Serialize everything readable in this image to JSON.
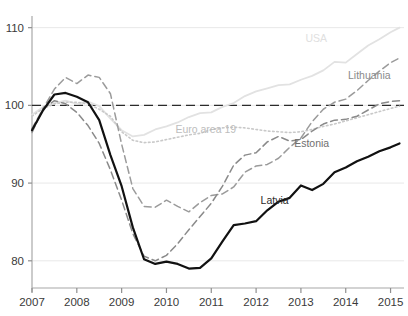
{
  "chart_data": {
    "type": "line",
    "title": "",
    "subtitle": "",
    "xlabel": "",
    "ylabel": "",
    "xlim": [
      2007.0,
      2015.3
    ],
    "ylim": [
      76.5,
      111.5
    ],
    "xticks": [
      2007,
      2008,
      2009,
      2010,
      2011,
      2012,
      2013,
      2014,
      2015
    ],
    "xtick_labels": [
      "2007",
      "2008",
      "2009",
      "2010",
      "2011",
      "2012",
      "2013",
      "2014",
      "2015"
    ],
    "yticks": [
      80,
      90,
      100,
      110
    ],
    "ytick_labels": [
      "80",
      "90",
      "100",
      "110"
    ],
    "grid": "horizontal",
    "legend_position": "inline-labels",
    "reference_line": {
      "value": 100,
      "style": "dashed",
      "color": "#2b2b2b"
    },
    "series": [
      {
        "name": "Latvia",
        "style": "solid",
        "width": 2.2,
        "color": "#111111",
        "label_color": "#2b2b2b",
        "label_x": 2012.1,
        "label_y": 87.3,
        "x": [
          2007.0,
          2007.25,
          2007.5,
          2007.75,
          2008.0,
          2008.25,
          2008.5,
          2008.75,
          2009.0,
          2009.25,
          2009.5,
          2009.75,
          2010.0,
          2010.25,
          2010.5,
          2010.75,
          2011.0,
          2011.25,
          2011.5,
          2011.75,
          2012.0,
          2012.25,
          2012.5,
          2012.75,
          2013.0,
          2013.25,
          2013.5,
          2013.75,
          2014.0,
          2014.25,
          2014.5,
          2014.75,
          2015.0,
          2015.2
        ],
        "y": [
          96.8,
          99.4,
          101.4,
          101.6,
          101.1,
          100.4,
          98.1,
          93.6,
          89.6,
          84.3,
          80.2,
          79.6,
          79.9,
          79.6,
          79.0,
          79.1,
          80.3,
          82.5,
          84.6,
          84.8,
          85.1,
          86.5,
          87.6,
          88.1,
          89.7,
          89.1,
          89.9,
          91.4,
          92.0,
          92.8,
          93.4,
          94.1,
          94.6,
          95.1
        ]
      },
      {
        "name": "Estonia",
        "style": "dashed",
        "width": 1.5,
        "color": "#8a8a8a",
        "label_color": "#6f6f6f",
        "label_x": 2012.85,
        "label_y": 94.6,
        "x": [
          2007.0,
          2007.25,
          2007.5,
          2007.75,
          2008.0,
          2008.25,
          2008.5,
          2008.75,
          2009.0,
          2009.25,
          2009.5,
          2009.75,
          2010.0,
          2010.25,
          2010.5,
          2010.75,
          2011.0,
          2011.25,
          2011.5,
          2011.75,
          2012.0,
          2012.25,
          2012.5,
          2012.75,
          2013.0,
          2013.25,
          2013.5,
          2013.75,
          2014.0,
          2014.25,
          2014.5,
          2014.75,
          2015.0,
          2015.2
        ],
        "y": [
          97.0,
          99.6,
          100.6,
          100.2,
          99.1,
          97.4,
          95.1,
          91.7,
          87.8,
          83.5,
          80.6,
          80.0,
          80.7,
          82.2,
          84.0,
          85.7,
          87.4,
          89.6,
          92.3,
          93.6,
          93.9,
          95.3,
          96.0,
          95.4,
          95.6,
          96.7,
          97.6,
          98.1,
          98.2,
          98.6,
          99.4,
          100.2,
          100.5,
          100.6
        ]
      },
      {
        "name": "Lithuania",
        "style": "dashed",
        "width": 1.5,
        "color": "#9b9b9b",
        "label_color": "#8a8a8a",
        "label_x": 2014.05,
        "label_y": 103.4,
        "x": [
          2007.0,
          2007.25,
          2007.5,
          2007.75,
          2008.0,
          2008.25,
          2008.5,
          2008.75,
          2009.0,
          2009.25,
          2009.5,
          2009.75,
          2010.0,
          2010.25,
          2010.5,
          2010.75,
          2011.0,
          2011.25,
          2011.5,
          2011.75,
          2012.0,
          2012.25,
          2012.5,
          2012.75,
          2013.0,
          2013.25,
          2013.5,
          2013.75,
          2014.0,
          2014.25,
          2014.5,
          2014.75,
          2015.0,
          2015.2
        ],
        "y": [
          96.5,
          99.6,
          102.1,
          103.6,
          102.8,
          103.9,
          103.6,
          101.5,
          95.0,
          89.3,
          87.0,
          86.9,
          87.8,
          87.0,
          86.3,
          87.5,
          88.4,
          88.6,
          89.5,
          91.4,
          92.2,
          92.4,
          93.2,
          94.6,
          95.8,
          97.9,
          99.5,
          100.4,
          100.8,
          101.9,
          103.2,
          104.4,
          105.5,
          106.1
        ]
      },
      {
        "name": "Euro area 19",
        "style": "dotted",
        "width": 1.6,
        "color": "#c9c9c9",
        "label_color": "#bdbdbd",
        "label_x": 2010.2,
        "label_y": 96.5,
        "x": [
          2007.0,
          2007.25,
          2007.5,
          2007.75,
          2008.0,
          2008.25,
          2008.5,
          2008.75,
          2009.0,
          2009.25,
          2009.5,
          2009.75,
          2010.0,
          2010.25,
          2010.5,
          2010.75,
          2011.0,
          2011.25,
          2011.5,
          2011.75,
          2012.0,
          2012.25,
          2012.5,
          2012.75,
          2013.0,
          2013.25,
          2013.5,
          2013.75,
          2014.0,
          2014.25,
          2014.5,
          2014.75,
          2015.0,
          2015.2
        ],
        "y": [
          98.6,
          99.6,
          100.2,
          100.4,
          100.4,
          100.2,
          99.5,
          98.6,
          96.6,
          95.5,
          95.2,
          95.3,
          95.6,
          95.9,
          96.2,
          96.4,
          96.9,
          97.1,
          97.2,
          97.1,
          96.9,
          96.7,
          96.6,
          96.5,
          96.6,
          96.9,
          97.3,
          97.6,
          98.0,
          98.4,
          98.8,
          99.2,
          99.6,
          99.9
        ]
      },
      {
        "name": "USA",
        "style": "solid",
        "width": 1.8,
        "color": "#e2e2e2",
        "label_color": "#e0e0e0",
        "label_x": 2013.1,
        "label_y": 108.1,
        "x": [
          2007.0,
          2007.25,
          2007.5,
          2007.75,
          2008.0,
          2008.25,
          2008.5,
          2008.75,
          2009.0,
          2009.25,
          2009.5,
          2009.75,
          2010.0,
          2010.25,
          2010.5,
          2010.75,
          2011.0,
          2011.25,
          2011.5,
          2011.75,
          2012.0,
          2012.25,
          2012.5,
          2012.75,
          2013.0,
          2013.25,
          2013.5,
          2013.75,
          2014.0,
          2014.25,
          2014.5,
          2014.75,
          2015.0,
          2015.2
        ],
        "y": [
          98.8,
          99.8,
          100.3,
          100.6,
          100.2,
          100.5,
          99.9,
          98.3,
          96.8,
          96.0,
          96.2,
          96.9,
          97.3,
          97.8,
          98.5,
          99.0,
          99.1,
          99.8,
          100.3,
          101.2,
          101.8,
          102.2,
          102.6,
          102.7,
          103.3,
          103.8,
          104.5,
          105.6,
          105.5,
          106.6,
          107.7,
          108.5,
          109.4,
          110.0
        ]
      }
    ]
  }
}
